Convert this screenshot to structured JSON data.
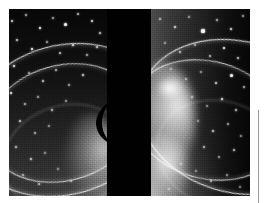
{
  "figure": {
    "kind": "astronomical-photograph",
    "subject_label": "Neptune ring system",
    "plate": {
      "left_px": 9,
      "top_px": 9,
      "width_px": 241,
      "height_px": 187,
      "background_color": "#000000"
    },
    "frames": [
      {
        "id": "left-exposure",
        "label": "Left exposure",
        "left_px": 0,
        "width_px": 98,
        "glow_side": "bottom-right",
        "ring_arc_orientation": "opens-right"
      },
      {
        "id": "right-exposure",
        "label": "Right exposure",
        "left_px": 142,
        "width_px": 99,
        "glow_side": "left",
        "ring_arc_orientation": "opens-left"
      }
    ],
    "occulting_bar": {
      "label": "Occulting bar",
      "left_px": 98,
      "width_px": 44,
      "color": "#010101"
    },
    "planet_crescent": {
      "label": "Occulted planetary limb crescent",
      "color": "#000000"
    },
    "rings": [
      {
        "id": "outer-ring",
        "label": "Outer ring arc",
        "brightness": "bright",
        "stroke_color": "#ffffff"
      },
      {
        "id": "inner-ring",
        "label": "Inner ring arc",
        "brightness": "bright",
        "stroke_color": "#ffffff"
      },
      {
        "id": "faint-ring",
        "label": "Faint dusty arc",
        "brightness": "faint",
        "stroke_color": "#ffffff"
      }
    ],
    "palette": {
      "plate_black": "#000000",
      "frame_shadow": "#050505",
      "highlight_white": "#ffffff",
      "mid_gray": "#4d4d4d",
      "margin_rule_gray": "#9a9a9a",
      "page_background": "#ffffff"
    },
    "margin_rule": {
      "label": "Right margin rule",
      "color": "#9a9a9a",
      "left_px": 258,
      "top_px": 110,
      "height_px": 93
    },
    "stars_left": [
      {
        "x": 3,
        "y": 12,
        "r": 1.0,
        "o": 0.75
      },
      {
        "x": 17,
        "y": 6,
        "r": 0.9,
        "o": 0.6
      },
      {
        "x": 31,
        "y": 19,
        "r": 1.3,
        "o": 0.9
      },
      {
        "x": 44,
        "y": 9,
        "r": 0.8,
        "o": 0.55
      },
      {
        "x": 56,
        "y": 15,
        "r": 1.5,
        "o": 0.95
      },
      {
        "x": 69,
        "y": 5,
        "r": 0.9,
        "o": 0.65
      },
      {
        "x": 83,
        "y": 12,
        "r": 1.2,
        "o": 0.8
      },
      {
        "x": 91,
        "y": 24,
        "r": 1.0,
        "o": 0.7
      },
      {
        "x": 8,
        "y": 31,
        "r": 1.1,
        "o": 0.72
      },
      {
        "x": 23,
        "y": 40,
        "r": 1.4,
        "o": 0.92
      },
      {
        "x": 38,
        "y": 33,
        "r": 0.9,
        "o": 0.58
      },
      {
        "x": 51,
        "y": 44,
        "r": 1.0,
        "o": 0.68
      },
      {
        "x": 64,
        "y": 36,
        "r": 1.2,
        "o": 0.82
      },
      {
        "x": 78,
        "y": 46,
        "r": 0.9,
        "o": 0.6
      },
      {
        "x": 88,
        "y": 38,
        "r": 1.1,
        "o": 0.74
      },
      {
        "x": 5,
        "y": 57,
        "r": 1.3,
        "o": 0.85
      },
      {
        "x": 20,
        "y": 64,
        "r": 0.9,
        "o": 0.56
      },
      {
        "x": 34,
        "y": 72,
        "r": 1.1,
        "o": 0.7
      },
      {
        "x": 47,
        "y": 61,
        "r": 1.0,
        "o": 0.64
      },
      {
        "x": 60,
        "y": 76,
        "r": 0.9,
        "o": 0.58
      },
      {
        "x": 74,
        "y": 66,
        "r": 1.2,
        "o": 0.78
      },
      {
        "x": 2,
        "y": 84,
        "r": 1.4,
        "o": 0.88
      },
      {
        "x": 16,
        "y": 95,
        "r": 1.0,
        "o": 0.62
      },
      {
        "x": 29,
        "y": 88,
        "r": 0.9,
        "o": 0.55
      },
      {
        "x": 43,
        "y": 101,
        "r": 1.1,
        "o": 0.68
      },
      {
        "x": 57,
        "y": 92,
        "r": 0.9,
        "o": 0.52
      },
      {
        "x": 11,
        "y": 112,
        "r": 1.2,
        "o": 0.72
      },
      {
        "x": 26,
        "y": 124,
        "r": 1.0,
        "o": 0.6
      },
      {
        "x": 40,
        "y": 117,
        "r": 0.9,
        "o": 0.5
      },
      {
        "x": 7,
        "y": 138,
        "r": 1.1,
        "o": 0.66
      },
      {
        "x": 22,
        "y": 150,
        "r": 1.2,
        "o": 0.7
      },
      {
        "x": 36,
        "y": 144,
        "r": 0.9,
        "o": 0.48
      },
      {
        "x": 14,
        "y": 166,
        "r": 1.0,
        "o": 0.58
      },
      {
        "x": 30,
        "y": 175,
        "r": 1.1,
        "o": 0.62
      },
      {
        "x": 49,
        "y": 160,
        "r": 0.9,
        "o": 0.46
      },
      {
        "x": 62,
        "y": 172,
        "r": 1.0,
        "o": 0.5
      }
    ],
    "stars_right": [
      {
        "x": 9,
        "y": 10,
        "r": 1.0,
        "o": 0.6
      },
      {
        "x": 24,
        "y": 18,
        "r": 1.3,
        "o": 0.78
      },
      {
        "x": 38,
        "y": 8,
        "r": 0.9,
        "o": 0.52
      },
      {
        "x": 52,
        "y": 22,
        "r": 1.6,
        "o": 0.95
      },
      {
        "x": 66,
        "y": 11,
        "r": 1.0,
        "o": 0.62
      },
      {
        "x": 80,
        "y": 20,
        "r": 1.2,
        "o": 0.8
      },
      {
        "x": 92,
        "y": 7,
        "r": 0.9,
        "o": 0.56
      },
      {
        "x": 14,
        "y": 34,
        "r": 0.9,
        "o": 0.48
      },
      {
        "x": 29,
        "y": 43,
        "r": 1.1,
        "o": 0.64
      },
      {
        "x": 44,
        "y": 36,
        "r": 0.9,
        "o": 0.5
      },
      {
        "x": 59,
        "y": 47,
        "r": 1.0,
        "o": 0.62
      },
      {
        "x": 73,
        "y": 39,
        "r": 1.4,
        "o": 0.88
      },
      {
        "x": 87,
        "y": 49,
        "r": 1.1,
        "o": 0.7
      },
      {
        "x": 20,
        "y": 60,
        "r": 0.9,
        "o": 0.46
      },
      {
        "x": 35,
        "y": 70,
        "r": 1.0,
        "o": 0.56
      },
      {
        "x": 50,
        "y": 63,
        "r": 0.9,
        "o": 0.48
      },
      {
        "x": 65,
        "y": 74,
        "r": 1.2,
        "o": 0.76
      },
      {
        "x": 80,
        "y": 66,
        "r": 1.5,
        "o": 0.92
      },
      {
        "x": 93,
        "y": 78,
        "r": 1.0,
        "o": 0.62
      },
      {
        "x": 41,
        "y": 88,
        "r": 1.0,
        "o": 0.54
      },
      {
        "x": 56,
        "y": 97,
        "r": 0.9,
        "o": 0.48
      },
      {
        "x": 71,
        "y": 90,
        "r": 1.3,
        "o": 0.82
      },
      {
        "x": 85,
        "y": 101,
        "r": 1.1,
        "o": 0.68
      },
      {
        "x": 47,
        "y": 112,
        "r": 0.9,
        "o": 0.46
      },
      {
        "x": 62,
        "y": 122,
        "r": 1.2,
        "o": 0.72
      },
      {
        "x": 77,
        "y": 115,
        "r": 1.0,
        "o": 0.58
      },
      {
        "x": 90,
        "y": 127,
        "r": 0.9,
        "o": 0.5
      },
      {
        "x": 53,
        "y": 138,
        "r": 1.1,
        "o": 0.62
      },
      {
        "x": 68,
        "y": 148,
        "r": 1.0,
        "o": 0.54
      },
      {
        "x": 83,
        "y": 141,
        "r": 1.2,
        "o": 0.68
      },
      {
        "x": 45,
        "y": 162,
        "r": 0.9,
        "o": 0.44
      },
      {
        "x": 60,
        "y": 172,
        "r": 1.1,
        "o": 0.58
      },
      {
        "x": 76,
        "y": 166,
        "r": 1.0,
        "o": 0.52
      },
      {
        "x": 89,
        "y": 178,
        "r": 0.9,
        "o": 0.46
      },
      {
        "x": 30,
        "y": 155,
        "r": 0.9,
        "o": 0.4
      },
      {
        "x": 18,
        "y": 180,
        "r": 1.0,
        "o": 0.44
      }
    ]
  }
}
